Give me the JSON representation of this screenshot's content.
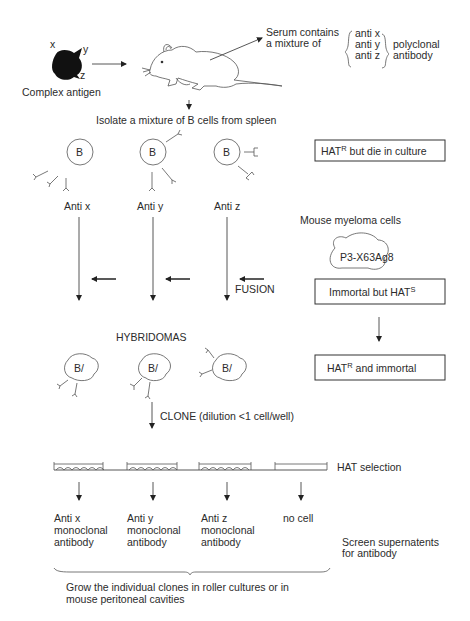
{
  "antigen": {
    "label": "Complex antigen",
    "epitopes": [
      "x",
      "y",
      "z"
    ]
  },
  "serum": {
    "line1": "Serum contains",
    "line2": "a mixture of",
    "antibodies": [
      "anti x",
      "anti y",
      "anti z"
    ],
    "group_label_1": "polyclonal",
    "group_label_2": "antibody"
  },
  "isolate_step": "Isolate a mixture of B cells from spleen",
  "b_cells": [
    {
      "glyph": "B",
      "label": "Anti x"
    },
    {
      "glyph": "B",
      "label": "Anti y"
    },
    {
      "glyph": "B",
      "label": "Anti z"
    }
  ],
  "b_cell_note": {
    "main": "HAT",
    "sup": "R",
    "rest": " but die in culture"
  },
  "myeloma": {
    "title": "Mouse myeloma cells",
    "cell_line": "P3-X63Ag8",
    "status": {
      "main": "Immortal but HAT",
      "sup": "S"
    }
  },
  "fusion_label": "FUSION",
  "hybridomas": {
    "title": "HYBRIDOMAS",
    "glyph": "B/",
    "note": {
      "main": "HAT",
      "sup": "R",
      "rest": " and immortal"
    }
  },
  "clone_step": "CLONE (dilution <1 cell/well)",
  "hat_selection": "HAT selection",
  "wells": [
    {
      "line1": "Anti x",
      "line2": "monoclonal",
      "line3": "antibody"
    },
    {
      "line1": "Anti y",
      "line2": "monoclonal",
      "line3": "antibody"
    },
    {
      "line1": "Anti z",
      "line2": "monoclonal",
      "line3": "antibody"
    },
    {
      "line1": "no cell",
      "line2": "",
      "line3": ""
    }
  ],
  "screen": {
    "line1": "Screen supernatents",
    "line2": "for antibody"
  },
  "grow": {
    "line1": "Grow the individual clones in roller cultures or in",
    "line2": "mouse peritoneal cavities"
  }
}
